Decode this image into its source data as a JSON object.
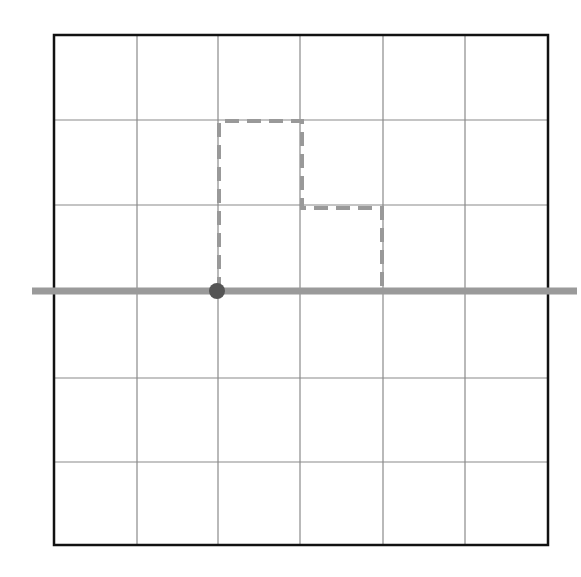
{
  "diagram": {
    "type": "grid-path",
    "canvas": {
      "width": 581,
      "height": 577
    },
    "grid": {
      "columns": 6,
      "rows": 6,
      "left": 54,
      "top": 35,
      "right": 548,
      "bottom": 545,
      "vertical_lines_x": [
        137,
        218,
        300,
        383,
        465
      ],
      "horizontal_lines_y": [
        120,
        205,
        290,
        378,
        462
      ],
      "border_color": "#111111",
      "line_color": "#8a8a8a"
    },
    "baseline": {
      "y": 291,
      "x_start": 32,
      "x_end": 577,
      "color": "#9a9a9a",
      "width": 7
    },
    "start_point": {
      "x": 217,
      "y": 291,
      "radius": 8,
      "color": "#555555"
    },
    "dashed_path": {
      "color": "#999999",
      "width": 4,
      "dash": "14 8",
      "points": [
        [
          219,
          291
        ],
        [
          219,
          121
        ],
        [
          302,
          121
        ],
        [
          302,
          208
        ],
        [
          382,
          208
        ],
        [
          382,
          291
        ]
      ]
    }
  }
}
